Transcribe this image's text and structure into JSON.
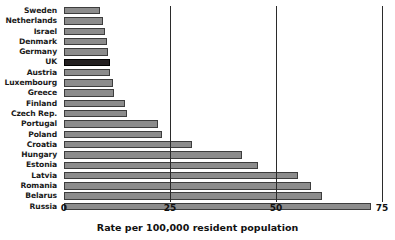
{
  "chart_data": {
    "type": "bar",
    "orientation": "horizontal",
    "title": "",
    "xlabel": "Rate per 100,000 resident population",
    "ylabel": "",
    "xlim": [
      0,
      75
    ],
    "xticks": [
      0,
      25,
      50,
      75
    ],
    "xtick_labels": [
      "0",
      "25",
      "50",
      "75"
    ],
    "grid": true,
    "grid_axis": "x",
    "legend": false,
    "highlight_category": "UK",
    "colors": {
      "bar_fill": "#8c8c8c",
      "bar_edge": "#3d3d3d",
      "highlight_fill": "#231f20",
      "gridline": "#2b2b2b",
      "text": "#111111",
      "background": "#ffffff"
    },
    "categories": [
      "Sweden",
      "Netherlands",
      "Israel",
      "Denmark",
      "Germany",
      "UK",
      "Austria",
      "Luxembourg",
      "Greece",
      "Finland",
      "Czech Rep.",
      "Portugal",
      "Poland",
      "Croatia",
      "Hungary",
      "Estonia",
      "Latvia",
      "Romania",
      "Belarus",
      "Russia"
    ],
    "values": [
      8.5,
      9.2,
      9.7,
      10.1,
      10.4,
      10.8,
      10.9,
      11.6,
      11.7,
      14.4,
      14.9,
      22.2,
      23.1,
      30.2,
      41.9,
      45.8,
      55.2,
      58.3,
      60.8,
      72.4
    ],
    "bars": [
      {
        "label": "Sweden",
        "value": 8.5,
        "highlight": false
      },
      {
        "label": "Netherlands",
        "value": 9.2,
        "highlight": false
      },
      {
        "label": "Israel",
        "value": 9.7,
        "highlight": false
      },
      {
        "label": "Denmark",
        "value": 10.1,
        "highlight": false
      },
      {
        "label": "Germany",
        "value": 10.4,
        "highlight": false
      },
      {
        "label": "UK",
        "value": 10.8,
        "highlight": true
      },
      {
        "label": "Austria",
        "value": 10.9,
        "highlight": false
      },
      {
        "label": "Luxembourg",
        "value": 11.6,
        "highlight": false
      },
      {
        "label": "Greece",
        "value": 11.7,
        "highlight": false
      },
      {
        "label": "Finland",
        "value": 14.4,
        "highlight": false
      },
      {
        "label": "Czech Rep.",
        "value": 14.9,
        "highlight": false
      },
      {
        "label": "Portugal",
        "value": 22.2,
        "highlight": false
      },
      {
        "label": "Poland",
        "value": 23.1,
        "highlight": false
      },
      {
        "label": "Croatia",
        "value": 30.2,
        "highlight": false
      },
      {
        "label": "Hungary",
        "value": 41.9,
        "highlight": false
      },
      {
        "label": "Estonia",
        "value": 45.8,
        "highlight": false
      },
      {
        "label": "Latvia",
        "value": 55.2,
        "highlight": false
      },
      {
        "label": "Romania",
        "value": 58.3,
        "highlight": false
      },
      {
        "label": "Belarus",
        "value": 60.8,
        "highlight": false
      },
      {
        "label": "Russia",
        "value": 72.4,
        "highlight": false
      }
    ]
  }
}
